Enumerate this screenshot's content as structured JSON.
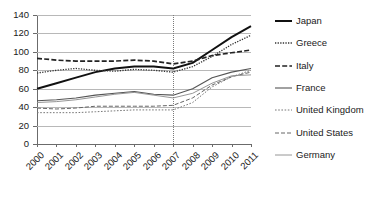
{
  "chart_data": {
    "type": "line",
    "title": "",
    "xlabel": "",
    "ylabel": "",
    "categories": [
      "2000",
      "2001",
      "2002",
      "2003",
      "2004",
      "2005",
      "2006",
      "2007",
      "2008",
      "2009",
      "2010",
      "2011"
    ],
    "x": [
      2000,
      2001,
      2002,
      2003,
      2004,
      2005,
      2006,
      2007,
      2008,
      2009,
      2010,
      2011
    ],
    "ylim": [
      0,
      140
    ],
    "yticks": [
      0,
      20,
      40,
      60,
      80,
      100,
      120,
      140
    ],
    "grid": true,
    "legend_position": "right",
    "annotations": [
      {
        "type": "vertical-line",
        "x": 2007,
        "style": "dotted",
        "label": ""
      }
    ],
    "series": [
      {
        "name": "Japan",
        "style": "solid-thick",
        "color": "#111111",
        "values": [
          60,
          66,
          72,
          78,
          82,
          84,
          84,
          82,
          88,
          102,
          116,
          128
        ]
      },
      {
        "name": "Greece",
        "style": "dotted-fine",
        "color": "#333333",
        "values": [
          77,
          80,
          82,
          80,
          79,
          81,
          80,
          78,
          84,
          95,
          108,
          118
        ]
      },
      {
        "name": "Italy",
        "style": "dashed",
        "color": "#222222",
        "values": [
          93,
          91,
          90,
          90,
          90,
          91,
          90,
          87,
          90,
          96,
          99,
          102
        ]
      },
      {
        "name": "France",
        "style": "solid-medium",
        "color": "#555555",
        "values": [
          47,
          48,
          50,
          53,
          55,
          57,
          54,
          53,
          60,
          72,
          78,
          82
        ]
      },
      {
        "name": "United Kingdom",
        "style": "dotted-coarse",
        "color": "#777777",
        "values": [
          34,
          34,
          34,
          35,
          36,
          37,
          37,
          37,
          45,
          62,
          73,
          80
        ]
      },
      {
        "name": "United States",
        "style": "dashed-thin",
        "color": "#666666",
        "values": [
          39,
          38,
          39,
          41,
          41,
          41,
          41,
          42,
          50,
          64,
          73,
          78
        ]
      },
      {
        "name": "Germany",
        "style": "solid-thin",
        "color": "#8a8a8a",
        "values": [
          45,
          46,
          48,
          51,
          54,
          56,
          53,
          50,
          55,
          66,
          74,
          75
        ]
      }
    ]
  }
}
